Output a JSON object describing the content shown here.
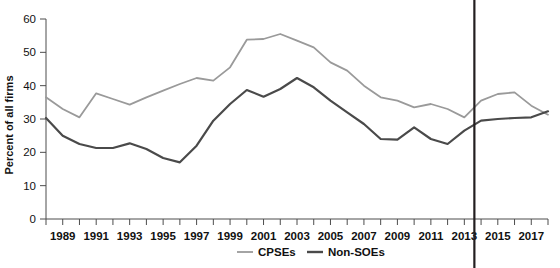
{
  "chart_data": {
    "type": "line",
    "title": "",
    "xlabel": "",
    "ylabel": "Percent of all firms",
    "ylim": [
      0,
      60
    ],
    "ytick_step": 10,
    "yticks": [
      "0",
      "10",
      "20",
      "30",
      "40",
      "50",
      "60"
    ],
    "xlim": [
      1988,
      2018
    ],
    "xticks": [
      "1989",
      "1991",
      "1993",
      "1995",
      "1997",
      "1999",
      "2001",
      "2003",
      "2005",
      "2007",
      "2009",
      "2011",
      "2013",
      "2015",
      "2017"
    ],
    "x": [
      1988,
      1989,
      1990,
      1991,
      1992,
      1993,
      1994,
      1995,
      1996,
      1997,
      1998,
      1999,
      2000,
      2001,
      2002,
      2003,
      2004,
      2005,
      2006,
      2007,
      2008,
      2009,
      2010,
      2011,
      2012,
      2013,
      2014,
      2015,
      2016,
      2017,
      2018
    ],
    "grid": false,
    "legend_position": "bottom-center",
    "series": [
      {
        "name": "CPSEs",
        "color": "#9a9a9a",
        "width": 1.8,
        "values": [
          36.5,
          33.0,
          30.5,
          37.7,
          36.0,
          34.3,
          36.5,
          38.5,
          40.5,
          42.3,
          41.5,
          45.5,
          53.8,
          54.0,
          55.5,
          53.5,
          51.5,
          47.0,
          44.5,
          40.0,
          36.5,
          35.5,
          33.5,
          34.5,
          33.0,
          30.5,
          35.5,
          37.5,
          38.0,
          34.0,
          31.3
        ]
      },
      {
        "name": "Non-SOEs",
        "color": "#4a4a4a",
        "width": 2.2,
        "values": [
          30.3,
          25.0,
          22.5,
          21.3,
          21.3,
          22.7,
          21.0,
          18.3,
          17.0,
          22.0,
          29.5,
          34.5,
          38.7,
          36.7,
          39.0,
          42.3,
          39.5,
          35.5,
          32.0,
          28.5,
          24.0,
          23.8,
          27.5,
          24.0,
          22.5,
          26.5,
          29.5,
          30.0,
          30.3,
          30.5,
          32.3
        ]
      }
    ],
    "annotations": [
      {
        "name": "reference-vertical-line",
        "kind": "vline",
        "x": 2013.6,
        "color": "#231f20"
      }
    ]
  },
  "legend": {
    "items": [
      {
        "label": "CPSEs",
        "color": "#9a9a9a"
      },
      {
        "label": "Non-SOEs",
        "color": "#4a4a4a"
      }
    ]
  }
}
